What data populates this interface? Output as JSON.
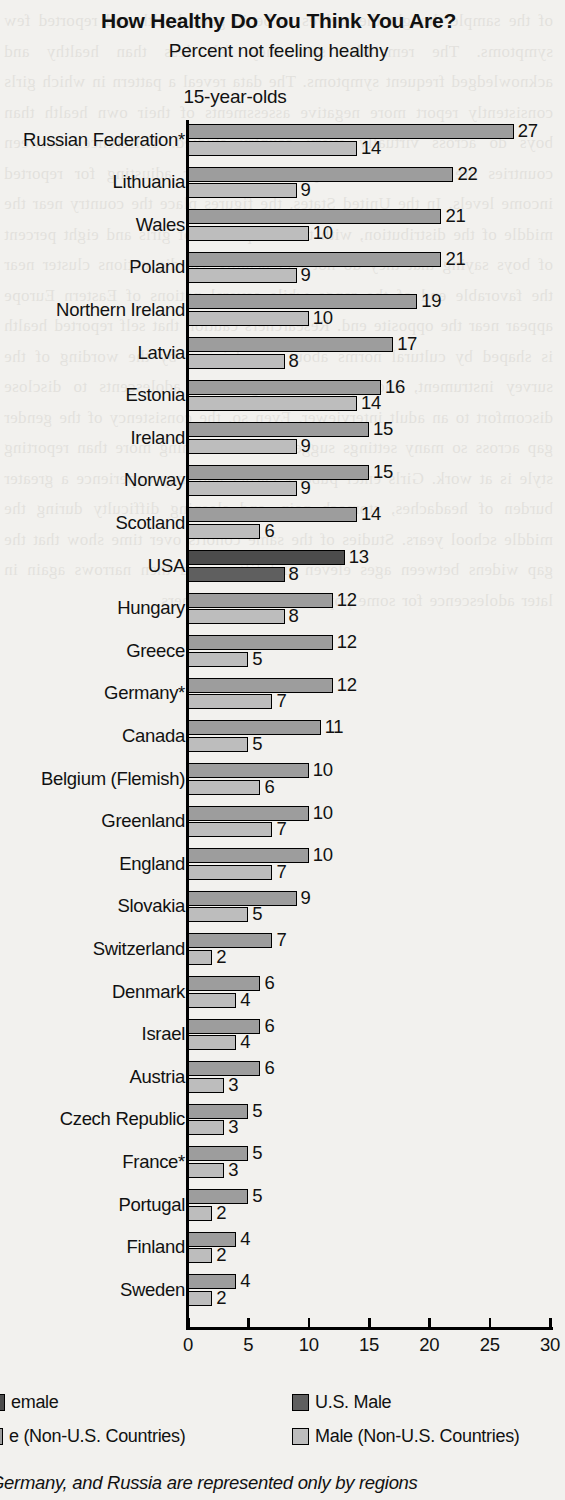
{
  "title": "How Healthy Do You Think You Are?",
  "subtitle": "Percent not feeling healthy",
  "age_group": "15-year-olds",
  "footnote": "Germany, and Russia are represented only by regions",
  "legend": {
    "us_female": "emale",
    "us_male": "U.S. Male",
    "female": "e (Non-U.S. Countries)",
    "male": "Male (Non-U.S. Countries)"
  },
  "chart_data": {
    "type": "bar",
    "orientation": "horizontal",
    "title": "How Healthy Do You Think You Are?",
    "subtitle": "Percent not feeling healthy",
    "annotation": "15-year-olds",
    "xlabel": "",
    "ylabel": "",
    "xlim": [
      0,
      30
    ],
    "xticks": [
      0,
      5,
      10,
      15,
      20,
      25,
      30
    ],
    "grid": false,
    "legend_position": "bottom",
    "categories": [
      "Russian Federation*",
      "Lithuania",
      "Wales",
      "Poland",
      "Northern Ireland",
      "Latvia",
      "Estonia",
      "Ireland",
      "Norway",
      "Scotland",
      "USA",
      "Hungary",
      "Greece",
      "Germany*",
      "Canada",
      "Belgium (Flemish)",
      "Greenland",
      "England",
      "Slovakia",
      "Switzerland",
      "Denmark",
      "Israel",
      "Austria",
      "Czech Republic",
      "France*",
      "Portugal",
      "Finland",
      "Sweden"
    ],
    "series": [
      {
        "name": "Female",
        "values": [
          27,
          22,
          21,
          21,
          19,
          17,
          16,
          15,
          15,
          14,
          13,
          12,
          12,
          12,
          11,
          10,
          10,
          10,
          9,
          7,
          6,
          6,
          6,
          5,
          5,
          5,
          4,
          4
        ]
      },
      {
        "name": "Male",
        "values": [
          14,
          9,
          10,
          9,
          10,
          8,
          14,
          9,
          9,
          6,
          8,
          8,
          5,
          7,
          5,
          6,
          7,
          7,
          5,
          2,
          4,
          4,
          3,
          3,
          3,
          2,
          2,
          2
        ]
      }
    ],
    "highlight_category": "USA"
  },
  "bleed_text": "of the sample thought themselves to be in good health and reported few symptoms. The remainder said they felt less than healthy and acknowledged frequent symptoms. The data reveal a pattern in which girls consistently report more negative assessments of their own health than boys do across virtually every country studied. Differences between countries are substantial and persist even after adjusting for reported income levels. In the United States, the figures place the country near the middle of the distribution, with thirteen percent of girls and eight percent of boys saying that they do not feel healthy. Nordic nations cluster near the favorable end of the range while several nations of Eastern Europe appear near the opposite end. Researchers caution that self reported health is shaped by cultural norms about complaining, by the wording of the survey instrument, and by the willingness of adolescents to disclose discomfort to an adult interviewer. Even so, the consistency of the gender gap across so many settings suggests that something more than reporting style is at work. Girls enter puberty earlier and may experience a greater burden of headaches, stomach pain, and sleeping difficulty during the middle school years. Studies of the same cohorts over time show that the gap widens between ages eleven and fifteen and then narrows again in later adolescence for some populations but not others."
}
